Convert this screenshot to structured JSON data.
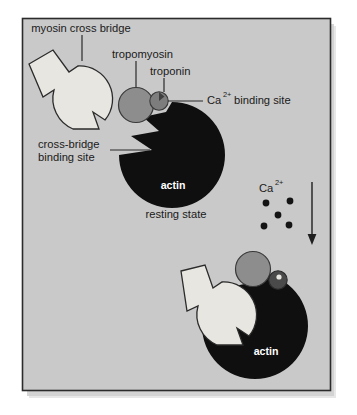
{
  "figure": {
    "panel": {
      "background_color": "#c9c9c9",
      "border_color": "#2b2b2b",
      "shadow": true
    },
    "colors": {
      "actin": "#100f0f",
      "tropomyosin": "#8d8d8d",
      "troponin_resting": "#7d7d7d",
      "troponin_bound": "#4a4a4a",
      "myosin_fill": "#e8e6e1",
      "outline": "#2b2b2b",
      "calcium_dot": "#141414",
      "label_text": "#1a1a1a",
      "inner_label_text": "#ffffff"
    }
  },
  "labels": {
    "myosin_cross_bridge": "myosin cross bridge",
    "tropomyosin": "tropomyosin",
    "troponin": "troponin",
    "ca_binding_site_prefix": "Ca",
    "ca_binding_site_sup": "2+",
    "ca_binding_site_suffix": "binding site",
    "cross_bridge_binding_line1": "cross-bridge",
    "cross_bridge_binding_line2": "binding site",
    "actin_top": "actin",
    "actin_bottom": "actin",
    "resting_state": "resting state",
    "calcium_prefix": "Ca",
    "calcium_sup": "2+"
  },
  "calcium_dots": [
    {
      "cx": 266,
      "cy": 203,
      "r": 3.4
    },
    {
      "cx": 290,
      "cy": 201,
      "r": 3.4
    },
    {
      "cx": 278,
      "cy": 215,
      "r": 3.4
    },
    {
      "cx": 264,
      "cy": 226,
      "r": 3.4
    },
    {
      "cx": 289,
      "cy": 225,
      "r": 3.4
    }
  ],
  "arrow": {
    "x": 312,
    "y_start": 182,
    "y_end": 243,
    "direction": "down"
  },
  "states": [
    {
      "name": "resting state",
      "description": "tropomyosin blocks the cross-bridge binding site on actin; myosin cross bridge is detached",
      "myosin_attached": false
    },
    {
      "name": "calcium bound state",
      "description": "Ca2+ binds troponin, tropomyosin shifts, myosin cross bridge docks into the actin binding site",
      "myosin_attached": true
    }
  ]
}
